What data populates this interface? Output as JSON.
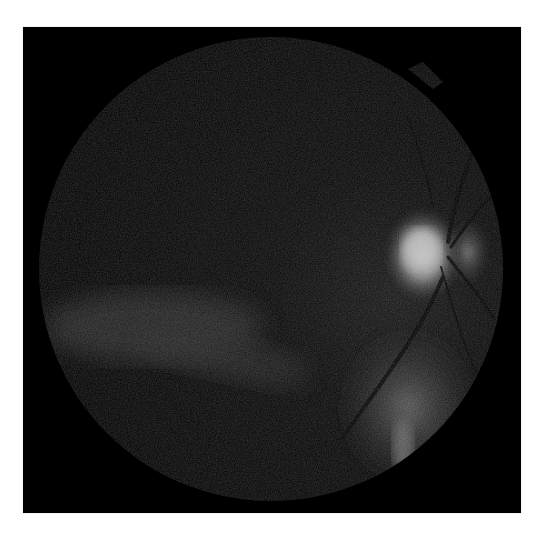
{
  "image": {
    "subject": "retinal fundus photograph",
    "mode": "grayscale",
    "background_color": "#ffffff",
    "frame_color": "#000000",
    "regions": [
      {
        "name": "fundus-field",
        "description": "circular imaged retina area, very dark with faint noise"
      },
      {
        "name": "optic-disc",
        "description": "bright blob on the right side of the field"
      },
      {
        "name": "blood-vessels",
        "description": "dark vessels radiating from the optic disc"
      },
      {
        "name": "inferior-bright-area",
        "description": "moderately bright area at lower right"
      },
      {
        "name": "inferior-temporal-band",
        "description": "faint lighter band across lower-left"
      }
    ]
  }
}
